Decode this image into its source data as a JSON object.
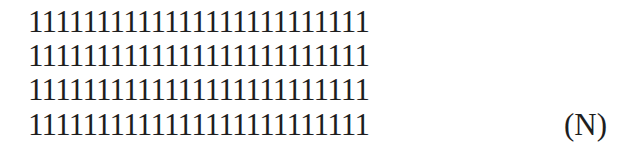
{
  "block": {
    "rows": [
      "1111111111111111111111111",
      "1111111111111111111111111",
      "1111111111111111111111111",
      "1111111111111111111111111"
    ],
    "digits_per_row": 25,
    "row_count": 4
  },
  "label": "(N)"
}
